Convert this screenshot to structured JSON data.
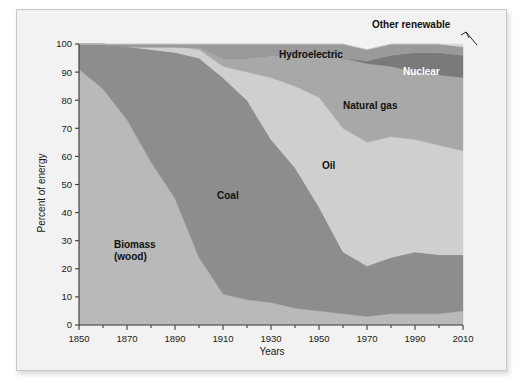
{
  "figure": {
    "background_color": "#f2f2f2",
    "border_color": "#c9c9c9"
  },
  "axes": {
    "y_title": "Percent of energy",
    "x_title": "Years",
    "y_ticks": [
      "0",
      "10",
      "20",
      "30",
      "40",
      "50",
      "60",
      "70",
      "80",
      "90",
      "100"
    ],
    "x_ticks": [
      "1850",
      "1870",
      "1890",
      "1910",
      "1930",
      "1950",
      "1970",
      "1990",
      "2010"
    ],
    "x_minor_ticks": [
      "1860",
      "1880",
      "1900",
      "1920",
      "1940",
      "1960",
      "1980",
      "2000"
    ]
  },
  "labels": {
    "biomass_line1": "Biomass",
    "biomass_line2": "(wood)",
    "coal": "Coal",
    "oil": "Oil",
    "natural_gas": "Natural gas",
    "nuclear": "Nuclear",
    "hydroelectric": "Hydroelectric",
    "other_renewable": "Other renewable"
  },
  "chart_data": {
    "type": "area",
    "title": "",
    "xlabel": "Years",
    "ylabel": "Percent of energy",
    "xlim": [
      1850,
      2010
    ],
    "ylim": [
      0,
      100
    ],
    "grid": false,
    "legend": "inline-labels",
    "stacked": true,
    "stack_order_bottom_to_top": [
      "Biomass (wood)",
      "Coal",
      "Oil",
      "Natural gas",
      "Nuclear",
      "Hydroelectric",
      "Other renewable"
    ],
    "x": [
      1850,
      1860,
      1870,
      1880,
      1890,
      1900,
      1910,
      1920,
      1930,
      1940,
      1950,
      1960,
      1970,
      1980,
      1990,
      2000,
      2010
    ],
    "series": [
      {
        "name": "Biomass (wood)",
        "color": "#b9b9b9",
        "values": [
          91,
          84,
          73,
          58,
          45,
          24,
          11,
          9,
          8,
          6,
          5,
          4,
          3,
          4,
          4,
          4,
          5
        ]
      },
      {
        "name": "Coal",
        "color": "#8d8d8d",
        "values": [
          9,
          16,
          26,
          40,
          52,
          71,
          77,
          71,
          58,
          50,
          37,
          22,
          18,
          20,
          22,
          21,
          20
        ]
      },
      {
        "name": "Oil",
        "color": "#cfcfcf",
        "values": [
          0,
          0,
          0,
          1,
          2,
          3,
          4,
          10,
          22,
          29,
          39,
          44,
          44,
          43,
          40,
          39,
          37
        ]
      },
      {
        "name": "Natural gas",
        "color": "#a8a8a8",
        "values": [
          0,
          0,
          0,
          0,
          0,
          1,
          3,
          5,
          8,
          11,
          15,
          25,
          28,
          25,
          24,
          25,
          26
        ]
      },
      {
        "name": "Nuclear",
        "color": "#7a7a7a",
        "values": [
          0,
          0,
          0,
          0,
          0,
          0,
          0,
          0,
          0,
          0,
          0,
          0,
          1,
          4,
          7,
          8,
          8
        ]
      },
      {
        "name": "Hydroelectric",
        "color": "#9a9a9a",
        "values": [
          0,
          0,
          1,
          1,
          1,
          1,
          5,
          5,
          4,
          4,
          4,
          5,
          4,
          4,
          3,
          3,
          3
        ]
      },
      {
        "name": "Other renewable",
        "color": "#d9d9d9",
        "values": [
          0,
          0,
          0,
          0,
          0,
          0,
          0,
          0,
          0,
          0,
          0,
          0,
          0,
          0,
          0,
          0,
          1
        ]
      }
    ]
  }
}
